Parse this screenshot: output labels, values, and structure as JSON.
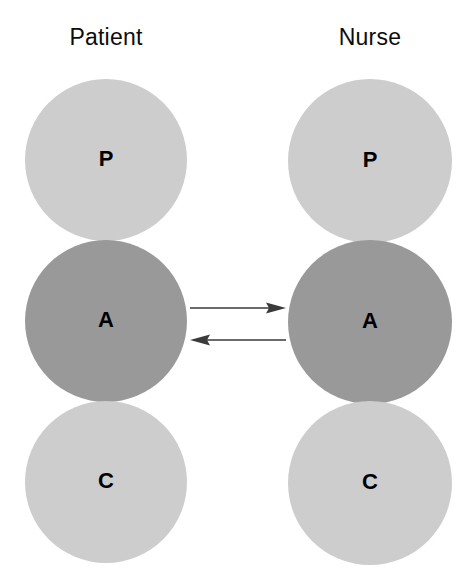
{
  "figure": {
    "type": "diagram",
    "background_color": "#ffffff"
  },
  "columns": [
    {
      "id": "patient",
      "title": "Patient",
      "nodes": [
        {
          "id": "patient-p",
          "label": "P",
          "ego_state": "Parent",
          "fill": "#cdcdcd",
          "shape": "circle"
        },
        {
          "id": "patient-a",
          "label": "A",
          "ego_state": "Adult",
          "fill": "#999999",
          "shape": "circle"
        },
        {
          "id": "patient-c",
          "label": "C",
          "ego_state": "Child",
          "fill": "#cdcdcd",
          "shape": "circle"
        }
      ]
    },
    {
      "id": "nurse",
      "title": "Nurse",
      "nodes": [
        {
          "id": "nurse-p",
          "label": "P",
          "ego_state": "Parent",
          "fill": "#cdcdcd",
          "shape": "circle"
        },
        {
          "id": "nurse-a",
          "label": "A",
          "ego_state": "Adult",
          "fill": "#999999",
          "shape": "circle"
        },
        {
          "id": "nurse-c",
          "label": "C",
          "ego_state": "Child",
          "fill": "#cdcdcd",
          "shape": "circle"
        }
      ]
    }
  ],
  "connectors": [
    {
      "id": "arrow-patient-to-nurse",
      "direction": "right",
      "from": "patient-a",
      "to": "nurse-a",
      "color": "#3a3a3a",
      "label": ""
    },
    {
      "id": "arrow-nurse-to-patient",
      "direction": "left",
      "from": "nurse-a",
      "to": "patient-a",
      "color": "#3a3a3a",
      "label": ""
    }
  ],
  "colors": {
    "light_gray": "#cdcdcd",
    "dark_gray": "#999999",
    "text": "#000000",
    "arrow": "#3a3a3a"
  }
}
